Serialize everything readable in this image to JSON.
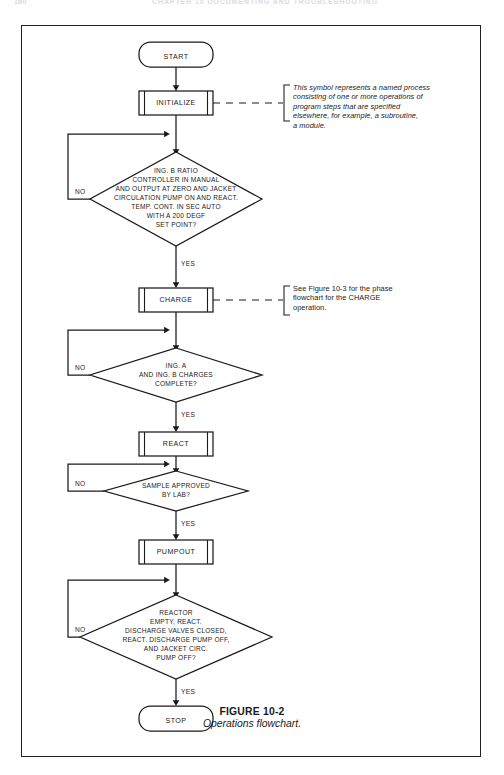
{
  "header": {
    "folio": "160",
    "running_title": "CHAPTER 10  DOCUMENTING AND TROUBLESHOOTING"
  },
  "figure": {
    "number": "FIGURE 10-2",
    "title": "Operations flowchart."
  },
  "nodes": {
    "start": "START",
    "initialize": "INITIALIZE",
    "decision1": [
      "ING. B RATIO",
      "CONTROLLER IN MANUAL",
      "AND OUTPUT AT ZERO AND JACKET",
      "CIRCULATION PUMP ON AND REACT.",
      "TEMP. CONT. IN SEC AUTO",
      "WITH A 200 DEGF",
      "SET POINT?"
    ],
    "charge": "CHARGE",
    "decision2": [
      "ING. A",
      "AND ING. B CHARGES",
      "COMPLETE?"
    ],
    "react": "REACT",
    "decision3": [
      "SAMPLE APPROVED",
      "BY LAB?"
    ],
    "pumpout": "PUMPOUT",
    "decision4": [
      "REACTOR",
      "EMPTY, REACT.",
      "DISCHARGE VALVES CLOSED,",
      "REACT. DISCHARGE PUMP OFF,",
      "AND JACKET CIRC.",
      "PUMP OFF?"
    ],
    "stop": "STOP"
  },
  "branches": {
    "no1": "NO",
    "yes1": "YES",
    "no2": "NO",
    "yes2": "YES",
    "no3": "NO",
    "yes3": "YES",
    "no4": "NO",
    "yes4": "YES"
  },
  "annotations": {
    "initialize_note": [
      "This symbol represents a named process",
      "consisting of one or more operations of",
      "program steps that are specified",
      "elsewhere, for example, a subroutine,",
      "a module."
    ],
    "charge_note": [
      "See Figure 10-3 for the phase",
      "flowchart for the CHARGE",
      "operation."
    ]
  },
  "colors": {
    "line": "#1a1a1a",
    "frame": "#231f20",
    "fill": "#ffffff"
  }
}
